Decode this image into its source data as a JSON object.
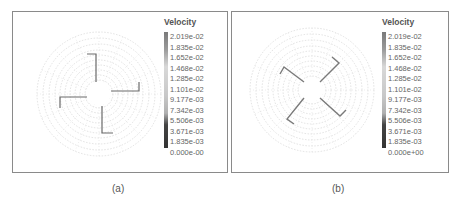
{
  "figure": {
    "panels": [
      {
        "id": "a",
        "caption": "(a)",
        "legend": {
          "title": "Velocity",
          "ticks": [
            "2.019e-02",
            "1.835e-02",
            "1.652e-02",
            "1.468e-02",
            "1.285e-02",
            "1.101e-02",
            "9.177e-03",
            "7.342e-03",
            "5.506e-03",
            "3.671e-03",
            "1.835e-03",
            "0.000e-00"
          ]
        },
        "description": "Velocity vector field on circular mesh, four straight radial blades with tangential tips"
      },
      {
        "id": "b",
        "caption": "(b)",
        "legend": {
          "title": "Velocity",
          "ticks": [
            "2.019e-02",
            "1.835e-02",
            "1.652e-02",
            "1.468e-02",
            "1.285e-02",
            "1.101e-02",
            "9.177e-03",
            "7.342e-03",
            "5.506e-03",
            "3.671e-03",
            "1.835e-03",
            "0.000e+00"
          ]
        },
        "description": "Velocity vector field on circular mesh, four diagonal blades rotated ~45 degrees"
      }
    ],
    "colors": {
      "frame": "#8a8a8a",
      "mesh": "#c8c8c8",
      "blade": "#6a6a6a",
      "colorbar_top": "#7a7a7a",
      "colorbar_mid": "#d0d0d0",
      "colorbar_bottom": "#333333"
    }
  }
}
